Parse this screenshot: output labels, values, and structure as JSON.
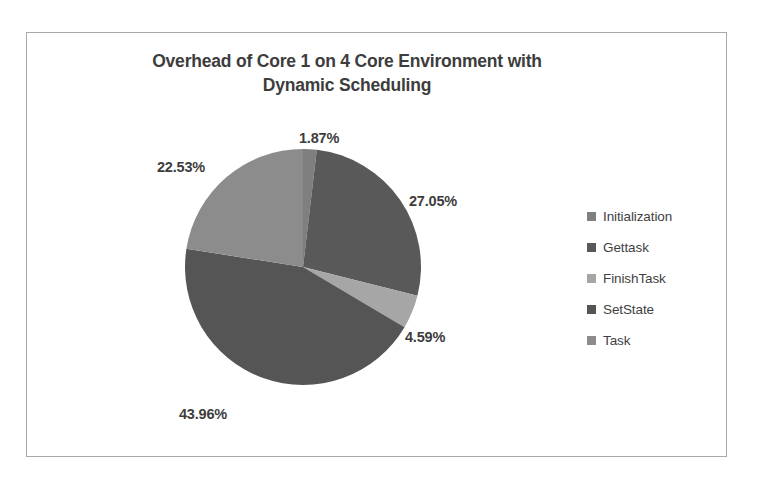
{
  "chart_data": {
    "type": "pie",
    "title": "Overhead of Core 1 on 4 Core Environment with Dynamic Scheduling",
    "title_line1": "Overhead of Core 1 on 4 Core Environment with",
    "title_line2": "Dynamic Scheduling",
    "xlabel": "",
    "ylabel": "",
    "categories": [
      "Initialization",
      "Gettask",
      "FinishTask",
      "SetState",
      "Task"
    ],
    "values": [
      1.87,
      27.05,
      4.59,
      43.96,
      22.53
    ],
    "value_labels": [
      "1.87%",
      "27.05%",
      "4.59%",
      "43.96%",
      "22.53%"
    ],
    "colors": [
      "#7f7f7f",
      "#595959",
      "#a6a6a6",
      "#555555",
      "#8c8c8c"
    ],
    "start_angle_deg": 0,
    "direction": "clockwise",
    "labels_position": "outside",
    "legend_position": "right",
    "grid": false,
    "series": [
      {
        "name": "Overhead share",
        "points": [
          {
            "label": "Initialization",
            "value": 1.87,
            "display": "1.87%",
            "color": "#7f7f7f"
          },
          {
            "label": "Gettask",
            "value": 27.05,
            "display": "27.05%",
            "color": "#595959"
          },
          {
            "label": "FinishTask",
            "value": 4.59,
            "display": "4.59%",
            "color": "#a6a6a6"
          },
          {
            "label": "SetState",
            "value": 43.96,
            "display": "43.96%",
            "color": "#555555"
          },
          {
            "label": "Task",
            "value": 22.53,
            "display": "22.53%",
            "color": "#8c8c8c"
          }
        ]
      }
    ]
  },
  "legend": {
    "items": [
      {
        "label": "Initialization",
        "color": "#7f7f7f"
      },
      {
        "label": "Gettask",
        "color": "#595959"
      },
      {
        "label": "FinishTask",
        "color": "#a6a6a6"
      },
      {
        "label": "SetState",
        "color": "#555555"
      },
      {
        "label": "Task",
        "color": "#8c8c8c"
      }
    ]
  }
}
